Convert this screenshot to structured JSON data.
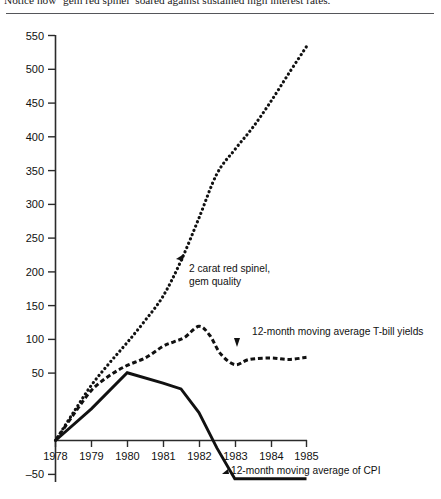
{
  "caption": "Notice how ‘gem red spinel’ soared against sustained high interest rates.",
  "axes": {
    "y_ticks": [
      "550",
      "500",
      "450",
      "400",
      "350",
      "300",
      "250",
      "200",
      "150",
      "100",
      "50",
      "–50"
    ],
    "x_ticks": [
      "1978",
      "1979",
      "1980",
      "1981",
      "1982",
      "1983",
      "1984",
      "1985"
    ]
  },
  "annotations": {
    "spinel_line1": "2 carat red spinel,",
    "spinel_line2": "gem quality",
    "tbill": "12-month moving average T-bill yields",
    "cpi": "12-month moving average of CPI"
  },
  "colors": {
    "ink": "#111111",
    "rule": "#55565a",
    "axis": "#2b2b2b"
  },
  "chart_data": {
    "type": "line",
    "title": "Notice how ‘gem red spinel’ soared against sustained high interest rates.",
    "xlabel": "",
    "ylabel": "",
    "xlim": [
      1978,
      1985
    ],
    "ylim": [
      -50,
      550
    ],
    "y_ticks": [
      -50,
      0,
      50,
      100,
      150,
      200,
      250,
      300,
      350,
      400,
      450,
      500,
      550
    ],
    "y_tick_labels": [
      "–50",
      "",
      "50",
      "100",
      "150",
      "200",
      "250",
      "300",
      "350",
      "400",
      "450",
      "500",
      "550"
    ],
    "x_ticks": [
      1978,
      1979,
      1980,
      1981,
      1982,
      1983,
      1984,
      1985
    ],
    "grid": false,
    "legend": "annotations",
    "series": [
      {
        "name": "2 carat red spinel, gem quality",
        "style": "dotted",
        "x": [
          1978,
          1978.5,
          1979,
          1979.5,
          1980,
          1980.5,
          1981,
          1981.5,
          1982,
          1982.5,
          1983,
          1983.5,
          1984,
          1984.5,
          1985
        ],
        "values": [
          0,
          38,
          75,
          105,
          133,
          163,
          196,
          244,
          302,
          362,
          395,
          425,
          460,
          498,
          535
        ]
      },
      {
        "name": "12-month moving average T-bill yields",
        "style": "dashed",
        "x": [
          1978,
          1978.5,
          1979,
          1979.5,
          1980,
          1980.5,
          1981,
          1981.3,
          1981.6,
          1982,
          1982.3,
          1982.6,
          1983,
          1983.4,
          1984,
          1984.5,
          1985
        ],
        "values": [
          0,
          35,
          68,
          88,
          102,
          112,
          128,
          134,
          140,
          155,
          143,
          118,
          103,
          110,
          112,
          110,
          113
        ]
      },
      {
        "name": "12-month moving average of CPI",
        "style": "solid",
        "x": [
          1978,
          1979,
          1980,
          1981,
          1981.5,
          1982,
          1982.5,
          1983,
          1984,
          1985
        ],
        "values": [
          0,
          43,
          92,
          78,
          70,
          38,
          -10,
          -52,
          -52,
          -52
        ]
      }
    ]
  }
}
